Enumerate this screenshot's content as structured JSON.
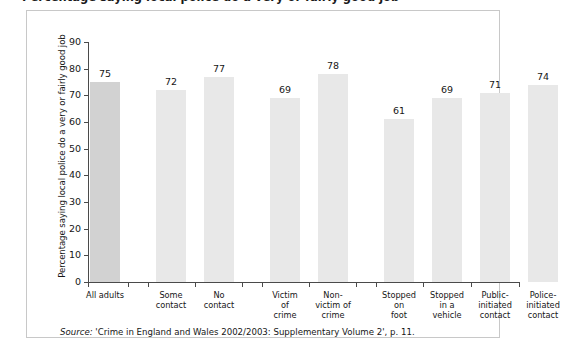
{
  "figure": {
    "title_partial": "Percentage saying local police do a very or fairly good job",
    "source_prefix": "Source:",
    "source_text": "'Crime in England and Wales 2002/2003: Supplementary Volume 2', p. 11."
  },
  "chart_data": {
    "type": "bar",
    "title": "",
    "xlabel": "",
    "ylabel": "Percentage saying local police do a very or fairly good job",
    "ylim": [
      0,
      90
    ],
    "ytick_values": [
      0,
      10,
      20,
      30,
      40,
      50,
      60,
      70,
      80,
      90
    ],
    "ytick_labels": [
      "0",
      "10",
      "20",
      "30",
      "40",
      "50",
      "60",
      "70",
      "80",
      "90"
    ],
    "grid": false,
    "legend": "none",
    "bar_color": "#e8e8e8",
    "first_bar_color": "#d2d2d2",
    "categories": [
      "All adults",
      "Some contact",
      "No contact",
      "Victim of crime",
      "Non-victim of crime",
      "Stopped on foot",
      "Stopped in a vehicle",
      "Public-initiated contact",
      "Police-initiated contact"
    ],
    "category_lines": [
      [
        "All adults"
      ],
      [
        "Some",
        "contact"
      ],
      [
        "No",
        "contact"
      ],
      [
        "Victim",
        "of",
        "crime"
      ],
      [
        "Non-",
        "victim of",
        "crime"
      ],
      [
        "Stopped",
        "on",
        "foot"
      ],
      [
        "Stopped",
        "in a",
        "vehicle"
      ],
      [
        "Public-",
        "initiated",
        "contact"
      ],
      [
        "Police-",
        "initiated",
        "contact"
      ]
    ],
    "values": [
      75,
      72,
      77,
      69,
      78,
      61,
      69,
      71,
      74
    ],
    "value_labels": [
      "75",
      "72",
      "77",
      "69",
      "78",
      "61",
      "69",
      "71",
      "74"
    ]
  }
}
